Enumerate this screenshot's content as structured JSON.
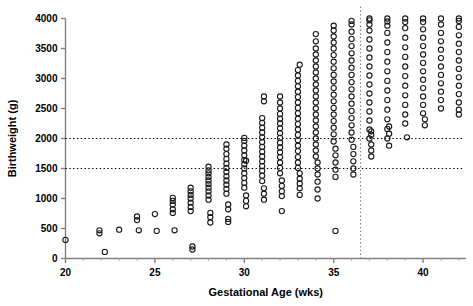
{
  "chart_data": {
    "type": "scatter",
    "title": "",
    "xlabel": "Gestational Age (wks)",
    "ylabel": "Birthweight (g)",
    "xlim": [
      20,
      42.4
    ],
    "ylim": [
      0,
      4000
    ],
    "xticks": [
      20,
      25,
      30,
      35,
      40
    ],
    "xtick_labels": [
      "20",
      "25",
      "30",
      "35",
      "40"
    ],
    "yticks": [
      0,
      500,
      1000,
      1500,
      2000,
      2500,
      3000,
      3500,
      4000
    ],
    "ytick_labels": [
      "0",
      "500",
      "1000",
      "1500",
      "2000",
      "2500",
      "3000",
      "3500",
      "4000"
    ],
    "minor_xticks": [
      21,
      22,
      23,
      24,
      26,
      27,
      28,
      29,
      31,
      32,
      33,
      34,
      36,
      37,
      38,
      39,
      41,
      42
    ],
    "grid": false,
    "marker": "open-circle",
    "marker_size": 4,
    "marker_color": "#1a1a1a",
    "axis_color": "#808080",
    "reference_lines": [
      {
        "name": "low-birthweight-2500-line",
        "orientation": "horizontal",
        "value": 2000,
        "style": "dotted",
        "color": "#000000"
      },
      {
        "name": "very-low-birthweight-1500-line",
        "orientation": "horizontal",
        "value": 1500,
        "style": "dotted",
        "color": "#000000"
      },
      {
        "name": "preterm-cutoff-line",
        "orientation": "vertical",
        "value": 36.5,
        "style": "dotted",
        "color": "#808080"
      }
    ],
    "series": [
      {
        "name": "births",
        "columns": [
          {
            "x": 20.0,
            "values": [
              310
            ]
          },
          {
            "x": 21.9,
            "values": [
              420,
              470
            ]
          },
          {
            "x": 22.2,
            "values": [
              110
            ]
          },
          {
            "x": 23.0,
            "values": [
              480
            ]
          },
          {
            "x": 24.0,
            "values": [
              640,
              700
            ]
          },
          {
            "x": 24.1,
            "values": [
              470
            ]
          },
          {
            "x": 25.0,
            "values": [
              740
            ]
          },
          {
            "x": 25.1,
            "values": [
              460
            ]
          },
          {
            "x": 26.0,
            "values": [
              760,
              820,
              900,
              960,
              1010
            ]
          },
          {
            "x": 26.1,
            "values": [
              470
            ]
          },
          {
            "x": 27.0,
            "values": [
              790,
              860,
              930,
              1000,
              1060,
              1120,
              1180
            ]
          },
          {
            "x": 27.1,
            "values": [
              150,
              200
            ]
          },
          {
            "x": 28.0,
            "values": [
              980,
              1050,
              1120,
              1180,
              1240,
              1300,
              1360,
              1420,
              1470,
              1530
            ]
          },
          {
            "x": 28.1,
            "values": [
              760,
              690,
              600
            ]
          },
          {
            "x": 29.0,
            "values": [
              1080,
              1160,
              1230,
              1300,
              1370,
              1440,
              1510,
              1580,
              1660,
              1740,
              1830,
              1900
            ]
          },
          {
            "x": 29.1,
            "values": [
              900,
              820,
              660,
              610
            ]
          },
          {
            "x": 30.0,
            "values": [
              1180,
              1260,
              1340,
              1420,
              1500,
              1570,
              1640,
              1720,
              1800,
              1880,
              1960,
              2010
            ]
          },
          {
            "x": 30.1,
            "values": [
              1050,
              960,
              870,
              1630
            ]
          },
          {
            "x": 31.0,
            "values": [
              1290,
              1380,
              1460,
              1540,
              1620,
              1700,
              1780,
              1860,
              1940,
              2020,
              2100,
              2180,
              2260,
              2340
            ]
          },
          {
            "x": 31.1,
            "values": [
              1170,
              1080,
              980,
              2700,
              2620
            ]
          },
          {
            "x": 32.0,
            "values": [
              1420,
              1510,
              1600,
              1690,
              1770,
              1850,
              1930,
              2010,
              2090,
              2170,
              2250,
              2330,
              2410,
              2500,
              2600,
              2700
            ]
          },
          {
            "x": 32.1,
            "values": [
              1300,
              1210,
              1120,
              1040,
              790
            ]
          },
          {
            "x": 33.0,
            "values": [
              1510,
              1600,
              1690,
              1790,
              1880,
              1970,
              2060,
              2150,
              2240,
              2330,
              2420,
              2510,
              2600,
              2690,
              2780,
              2870,
              2960,
              3050,
              3140
            ]
          },
          {
            "x": 33.1,
            "values": [
              1420,
              1330,
              1250,
              1170,
              1060,
              3230
            ]
          },
          {
            "x": 34.0,
            "values": [
              1700,
              1800,
              1900,
              2000,
              2100,
              2200,
              2300,
              2400,
              2500,
              2600,
              2700,
              2800,
              2900,
              3000,
              3100,
              3200,
              3300,
              3400,
              3500,
              3620,
              3740
            ]
          },
          {
            "x": 34.1,
            "values": [
              1600,
              1500,
              1400,
              1280,
              1150,
              1000
            ]
          },
          {
            "x": 35.0,
            "values": [
              1950,
              2070,
              2180,
              2290,
              2400,
              2510,
              2620,
              2730,
              2840,
              2950,
              3060,
              3170,
              3280,
              3390,
              3500,
              3600,
              3700,
              3800,
              3880
            ]
          },
          {
            "x": 35.1,
            "values": [
              1830,
              1720,
              1600,
              1480,
              1360,
              460
            ]
          },
          {
            "x": 36.0,
            "values": [
              1980,
              2100,
              2220,
              2340,
              2460,
              2580,
              2700,
              2820,
              2940,
              3060,
              3180,
              3300,
              3420,
              3540,
              3660,
              3780,
              3900,
              3960
            ]
          },
          {
            "x": 36.1,
            "values": [
              1860,
              1740,
              1620,
              1500,
              1400
            ]
          },
          {
            "x": 37.0,
            "values": [
              2000,
              2150,
              2300,
              2450,
              2600,
              2750,
              2900,
              3050,
              3200,
              3350,
              3500,
              3650,
              3800,
              3900,
              3970,
              4000
            ]
          },
          {
            "x": 37.1,
            "values": [
              1900,
              1800,
              1700,
              2060,
              2120
            ]
          },
          {
            "x": 38.0,
            "values": [
              2000,
              2160,
              2320,
              2480,
              2640,
              2800,
              2960,
              3120,
              3280,
              3440,
              3600,
              3760,
              3880,
              3950,
              4000
            ]
          },
          {
            "x": 38.1,
            "values": [
              1880,
              2080,
              2200
            ]
          },
          {
            "x": 39.0,
            "values": [
              2250,
              2400,
              2560,
              2720,
              2880,
              3040,
              3200,
              3360,
              3520,
              3680,
              3840,
              3940,
              4000
            ]
          },
          {
            "x": 39.1,
            "values": [
              2020
            ]
          },
          {
            "x": 40.0,
            "values": [
              2420,
              2560,
              2700,
              2840,
              2980,
              3120,
              3260,
              3400,
              3540,
              3680,
              3820,
              3940,
              4000
            ]
          },
          {
            "x": 40.1,
            "values": [
              2320,
              2220
            ]
          },
          {
            "x": 41.0,
            "values": [
              2500,
              2640,
              2780,
              2920,
              3060,
              3200,
              3340,
              3480,
              3620,
              3760,
              3900,
              4000
            ]
          },
          {
            "x": 42.0,
            "values": [
              2600,
              2740,
              2880,
              3020,
              3160,
              3300,
              3440,
              3580,
              3720,
              3860,
              3960,
              4000,
              2480,
              2400
            ]
          }
        ]
      }
    ]
  }
}
